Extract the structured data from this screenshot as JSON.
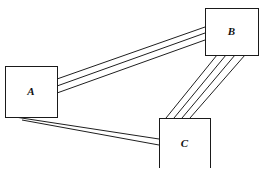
{
  "diagram": {
    "background_color": "#ffffff",
    "line_color": "#1f1f1f",
    "box_fill": "#ffffff",
    "box_stroke": "#1a1a1a",
    "nodes": [
      {
        "id": "A",
        "label": "A",
        "x": 5,
        "y": 66,
        "width": 52,
        "height": 51
      },
      {
        "id": "B",
        "label": "B",
        "x": 205,
        "y": 8,
        "width": 53,
        "height": 47
      },
      {
        "id": "C",
        "label": "C",
        "x": 159,
        "y": 118,
        "width": 51,
        "height": 50
      }
    ],
    "edges": [
      {
        "id": "A-B",
        "from": "A",
        "to": "B",
        "line_count": 3,
        "lines": [
          {
            "x1": 57,
            "y1": 79,
            "x2": 205,
            "y2": 27
          },
          {
            "x1": 57,
            "y1": 86,
            "x2": 205,
            "y2": 33
          },
          {
            "x1": 57,
            "y1": 93,
            "x2": 205,
            "y2": 40
          }
        ]
      },
      {
        "id": "B-C",
        "from": "B",
        "to": "C",
        "line_count": 4,
        "lines": [
          {
            "x1": 217,
            "y1": 55,
            "x2": 166,
            "y2": 118
          },
          {
            "x1": 226,
            "y1": 55,
            "x2": 174,
            "y2": 118
          },
          {
            "x1": 235,
            "y1": 55,
            "x2": 182,
            "y2": 118
          },
          {
            "x1": 245,
            "y1": 55,
            "x2": 190,
            "y2": 118
          }
        ]
      },
      {
        "id": "A-C",
        "from": "A",
        "to": "C",
        "line_count": 2,
        "lines": [
          {
            "x1": 15,
            "y1": 117,
            "x2": 159,
            "y2": 139
          },
          {
            "x1": 22,
            "y1": 120,
            "x2": 159,
            "y2": 145
          }
        ]
      }
    ]
  }
}
